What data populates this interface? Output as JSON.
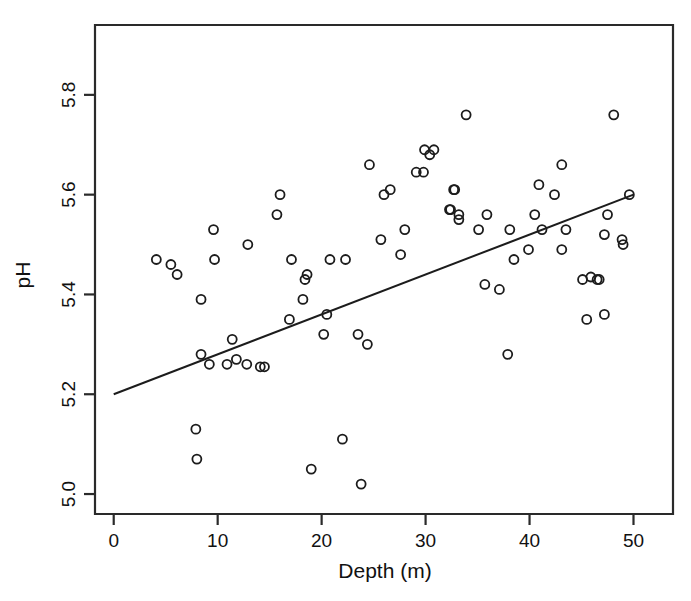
{
  "chart_data": {
    "type": "scatter",
    "title": "",
    "xlabel": "Depth (m)",
    "ylabel": "pH",
    "xlim": [
      -1.8,
      53.8
    ],
    "ylim": [
      4.96,
      5.94
    ],
    "grid": false,
    "legend": null,
    "xticks": [
      0,
      10,
      20,
      30,
      40,
      50
    ],
    "xtick_labels": [
      "0",
      "10",
      "20",
      "30",
      "40",
      "50"
    ],
    "yticks": [
      5.0,
      5.2,
      5.4,
      5.6,
      5.8
    ],
    "ytick_labels": [
      "5.0",
      "5.2",
      "5.4",
      "5.6",
      "5.8"
    ],
    "marker": "open-circle",
    "marker_radius_px": 4.5,
    "points": [
      [
        4.1,
        5.47
      ],
      [
        5.5,
        5.46
      ],
      [
        6.1,
        5.44
      ],
      [
        7.9,
        5.13
      ],
      [
        8.0,
        5.07
      ],
      [
        8.4,
        5.39
      ],
      [
        8.4,
        5.28
      ],
      [
        9.2,
        5.26
      ],
      [
        9.6,
        5.53
      ],
      [
        9.7,
        5.47
      ],
      [
        10.9,
        5.26
      ],
      [
        11.4,
        5.31
      ],
      [
        11.8,
        5.27
      ],
      [
        12.8,
        5.26
      ],
      [
        12.9,
        5.5
      ],
      [
        14.1,
        5.255
      ],
      [
        14.5,
        5.255
      ],
      [
        15.7,
        5.56
      ],
      [
        16.0,
        5.6
      ],
      [
        16.9,
        5.35
      ],
      [
        17.1,
        5.47
      ],
      [
        18.2,
        5.39
      ],
      [
        18.4,
        5.43
      ],
      [
        18.6,
        5.44
      ],
      [
        19.0,
        5.05
      ],
      [
        20.2,
        5.32
      ],
      [
        20.5,
        5.36
      ],
      [
        20.8,
        5.47
      ],
      [
        22.0,
        5.11
      ],
      [
        22.3,
        5.47
      ],
      [
        23.5,
        5.32
      ],
      [
        23.8,
        5.02
      ],
      [
        24.4,
        5.3
      ],
      [
        24.6,
        5.66
      ],
      [
        25.7,
        5.51
      ],
      [
        26.0,
        5.6
      ],
      [
        26.6,
        5.61
      ],
      [
        27.6,
        5.48
      ],
      [
        28.0,
        5.53
      ],
      [
        29.1,
        5.645
      ],
      [
        29.8,
        5.645
      ],
      [
        29.9,
        5.69
      ],
      [
        30.4,
        5.68
      ],
      [
        30.8,
        5.69
      ],
      [
        32.3,
        5.57
      ],
      [
        32.4,
        5.57
      ],
      [
        32.7,
        5.61
      ],
      [
        32.8,
        5.61
      ],
      [
        33.2,
        5.55
      ],
      [
        33.2,
        5.56
      ],
      [
        33.9,
        5.76
      ],
      [
        35.1,
        5.53
      ],
      [
        35.7,
        5.42
      ],
      [
        35.9,
        5.56
      ],
      [
        37.1,
        5.41
      ],
      [
        37.9,
        5.28
      ],
      [
        38.1,
        5.53
      ],
      [
        38.5,
        5.47
      ],
      [
        39.9,
        5.49
      ],
      [
        40.5,
        5.56
      ],
      [
        40.9,
        5.62
      ],
      [
        41.2,
        5.53
      ],
      [
        42.4,
        5.6
      ],
      [
        43.1,
        5.66
      ],
      [
        43.1,
        5.49
      ],
      [
        43.5,
        5.53
      ],
      [
        45.1,
        5.43
      ],
      [
        45.5,
        5.35
      ],
      [
        45.9,
        5.435
      ],
      [
        46.5,
        5.43
      ],
      [
        46.7,
        5.43
      ],
      [
        47.2,
        5.52
      ],
      [
        47.2,
        5.36
      ],
      [
        47.5,
        5.56
      ],
      [
        48.1,
        5.76
      ],
      [
        48.9,
        5.51
      ],
      [
        49.0,
        5.5
      ],
      [
        49.6,
        5.6
      ]
    ],
    "fit_line": {
      "label": "least-squares fit",
      "x": [
        0,
        50
      ],
      "y": [
        5.2,
        5.6
      ],
      "slope": 0.008,
      "intercept": 5.2
    },
    "colors": {
      "marker_stroke": "#1c1c1c",
      "line": "#1c1c1c",
      "frame": "#2a2a2a",
      "text": "#111111",
      "background": "#ffffff"
    }
  }
}
